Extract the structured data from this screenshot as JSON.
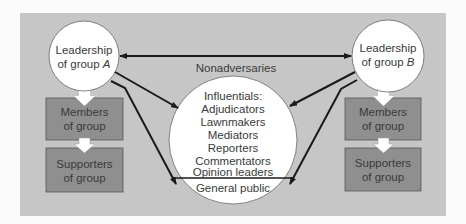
{
  "diagram": {
    "colors": {
      "background": "#fbfbfb",
      "panel": "#c6c6c6",
      "box": "#8f8f8f",
      "circle": "#ffffff",
      "line": "#1a1a1a",
      "text": "#3a3a3a"
    },
    "left": {
      "leader_line1": "Leadership",
      "leader_line2_prefix": "of group ",
      "leader_group": "A",
      "members_line1": "Members",
      "members_line2": "of group",
      "supporters_line1": "Supporters",
      "supporters_line2": "of group"
    },
    "right": {
      "leader_line1": "Leadership",
      "leader_line2_prefix": "of group ",
      "leader_group": "B",
      "members_line1": "Members",
      "members_line2": "of group",
      "supporters_line1": "Supporters",
      "supporters_line2": "of group"
    },
    "connector_label": "Nonadversaries",
    "center": {
      "heading": "Influentials:",
      "items": [
        "Adjudicators",
        "Lawnmakers",
        "Mediators",
        "Reporters",
        "Commentators",
        "Opinion leaders"
      ],
      "footer": "General public"
    }
  }
}
